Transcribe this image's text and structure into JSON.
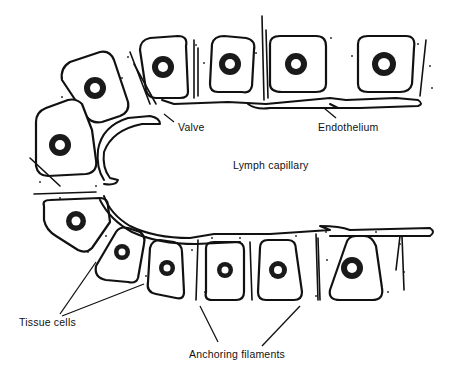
{
  "figure": {
    "type": "biological-schematic",
    "labels": {
      "valve": "Valve",
      "endothelium": "Endothelium",
      "lymph_capillary": "Lymph capillary",
      "tissue_cells": "Tissue cells",
      "anchoring_filaments": "Anchoring filaments"
    },
    "colors": {
      "ink": "#111111",
      "background": "#ffffff"
    }
  }
}
